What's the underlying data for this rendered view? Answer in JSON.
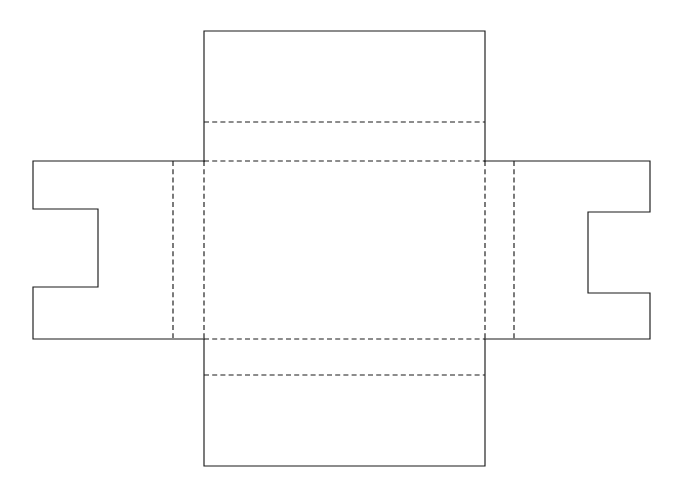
{
  "document": {
    "kind": "technical-line-drawing",
    "subject": "box-dieline-net",
    "description": "Unfolded packaging net: central square panel, top flap, bottom flap, and two side flaps with rectangular locking notches",
    "background_color": "#ffffff",
    "line_color": "#1a1a1a",
    "cut_line_style": "solid",
    "fold_line_style": "dashed",
    "canvas": {
      "width": 686,
      "height": 498
    }
  },
  "geometry": {
    "center_panel": {
      "x1": 204,
      "y1": 161,
      "x2": 485,
      "y2": 339
    },
    "top_flap": {
      "x1": 204,
      "y1": 31,
      "x2": 485,
      "y2": 161
    },
    "bottom_flap": {
      "x1": 204,
      "y1": 339,
      "x2": 485,
      "y2": 466
    },
    "left_flap": {
      "x1": 33,
      "y1": 161,
      "x2": 204,
      "y2": 338
    },
    "right_flap": {
      "x1": 485,
      "y1": 161,
      "x2": 650,
      "y2": 339
    },
    "left_notch": {
      "x1": 33,
      "y1": 209,
      "x2": 98,
      "y2": 287
    },
    "right_notch": {
      "x1": 588,
      "y1": 212,
      "x2": 650,
      "y2": 293
    },
    "fold_lines": {
      "top_flap_score": {
        "x1": 204,
        "y1": 122,
        "x2": 485,
        "y2": 122
      },
      "top_panel_fold": {
        "x1": 204,
        "y1": 161,
        "x2": 485,
        "y2": 161
      },
      "bottom_panel_fold": {
        "x1": 204,
        "y1": 339,
        "x2": 485,
        "y2": 339
      },
      "bottom_flap_score": {
        "x1": 204,
        "y1": 375,
        "x2": 485,
        "y2": 375
      },
      "left_outer_fold": {
        "x": 173,
        "y1": 161,
        "y2": 338
      },
      "left_panel_fold": {
        "x": 204,
        "y1": 161,
        "y2": 339
      },
      "right_panel_fold": {
        "x": 485,
        "y1": 161,
        "y2": 339
      },
      "right_outer_fold": {
        "x": 514,
        "y1": 161,
        "y2": 339
      }
    }
  },
  "paths": {
    "outline": "M 204 31 L 485 31 L 485 161 L 650 161 L 650 212 L 588 212 L 588 293 L 650 293 L 650 339 L 485 339 L 485 466 L 204 466 L 204 339 L 33 339 L 33 287 L 98 287 L 98 209 L 33 209 L 33 161 L 204 161 Z"
  },
  "elements": {
    "top_flap_label": "top flap",
    "bottom_flap_label": "bottom flap",
    "left_flap_label": "left side flap with notch",
    "right_flap_label": "right side flap with notch",
    "center_panel_label": "center base panel"
  }
}
